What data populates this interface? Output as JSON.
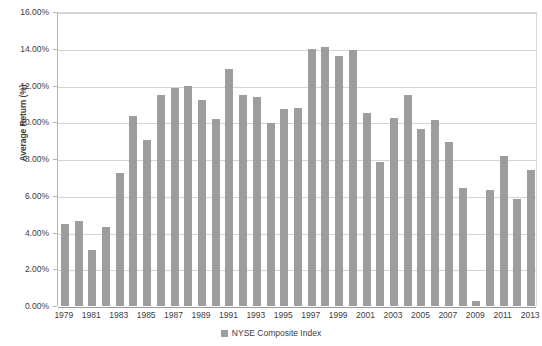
{
  "chart_data": {
    "type": "bar",
    "title": "",
    "xlabel": "",
    "ylabel": "Average Return (%)",
    "ylim": [
      0,
      16
    ],
    "ytick_values": [
      0,
      2,
      4,
      6,
      8,
      10,
      12,
      14,
      16
    ],
    "ytick_labels": [
      "0.00%",
      "2.00%",
      "4.00%",
      "6.00%",
      "8.00%",
      "10.00%",
      "12.00%",
      "14.00%",
      "16.00%"
    ],
    "grid": true,
    "legend_position": "bottom",
    "legend": [
      "NYSE Composite Index"
    ],
    "series_name": "NYSE Composite Index",
    "bar_color": "#9d9d9d",
    "categories": [
      "1979",
      "1980",
      "1981",
      "1982",
      "1983",
      "1984",
      "1985",
      "1986",
      "1987",
      "1988",
      "1989",
      "1990",
      "1991",
      "1992",
      "1993",
      "1994",
      "1995",
      "1996",
      "1997",
      "1998",
      "1999",
      "2000",
      "2001",
      "2002",
      "2003",
      "2004",
      "2005",
      "2006",
      "2007",
      "2008",
      "2009",
      "2010",
      "2011",
      "2012",
      "2013"
    ],
    "xtick_labels": [
      "1979",
      "1981",
      "1983",
      "1985",
      "1987",
      "1989",
      "1991",
      "1993",
      "1995",
      "1997",
      "1999",
      "2001",
      "2003",
      "2005",
      "2007",
      "2009",
      "2011",
      "2013"
    ],
    "values": [
      4.45,
      4.65,
      3.05,
      4.3,
      7.25,
      10.35,
      9.05,
      11.5,
      11.85,
      12.0,
      11.2,
      10.2,
      12.9,
      11.5,
      11.35,
      9.95,
      10.7,
      10.8,
      14.0,
      14.1,
      13.6,
      13.95,
      10.5,
      7.85,
      10.25,
      11.5,
      9.65,
      10.1,
      8.9,
      6.4,
      0.3,
      6.3,
      8.15,
      5.85,
      7.4
    ]
  }
}
